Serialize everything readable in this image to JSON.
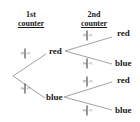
{
  "headers": {
    "first": {
      "line1": "1st",
      "line2": "counter"
    },
    "second": {
      "line1": "2nd",
      "line2": "counter"
    }
  },
  "first_branch": {
    "top": {
      "label": "red",
      "probability": {
        "num": "3",
        "den": "5"
      }
    },
    "bottom": {
      "label": "blue",
      "probability": {
        "num": "2",
        "den": "5"
      }
    }
  },
  "second_branch": {
    "red_red": {
      "label": "red",
      "probability": {
        "num": "3",
        "den": "5"
      }
    },
    "red_blue": {
      "label": "blue",
      "probability": {
        "num": "2",
        "den": "5"
      }
    },
    "blue_red": {
      "label": "red",
      "probability": {
        "num": "3",
        "den": "5"
      }
    },
    "blue_blue": {
      "label": "blue",
      "probability": {
        "num": "2",
        "den": "5"
      }
    }
  },
  "colors": {
    "line": "#8a8a8a",
    "text": "#1a1a1a",
    "background": "#ffffff"
  }
}
